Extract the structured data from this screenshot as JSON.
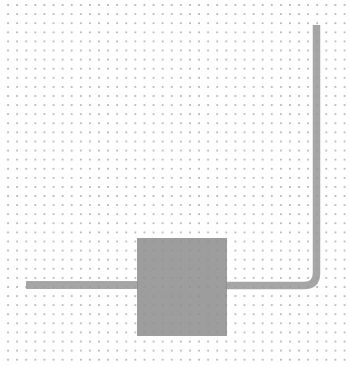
{
  "canvas": {
    "background": "#ffffff",
    "grid": {
      "type": "dot",
      "pitch_px": 9.1,
      "dot_color": "#b9b9b9"
    }
  },
  "diagram": {
    "block": {
      "label": "",
      "fill": "#8c8c8c",
      "x": 137,
      "y": 238,
      "width": 90,
      "height": 98
    },
    "wires": [
      {
        "id": "left-wire",
        "label": "",
        "from": [
          26,
          285
        ],
        "to": [
          137,
          285
        ]
      },
      {
        "id": "right-wire",
        "label": "",
        "from": [
          227,
          285
        ],
        "corner": [
          316,
          285
        ],
        "to": [
          316,
          25
        ]
      }
    ],
    "wire_color": "#969696"
  }
}
